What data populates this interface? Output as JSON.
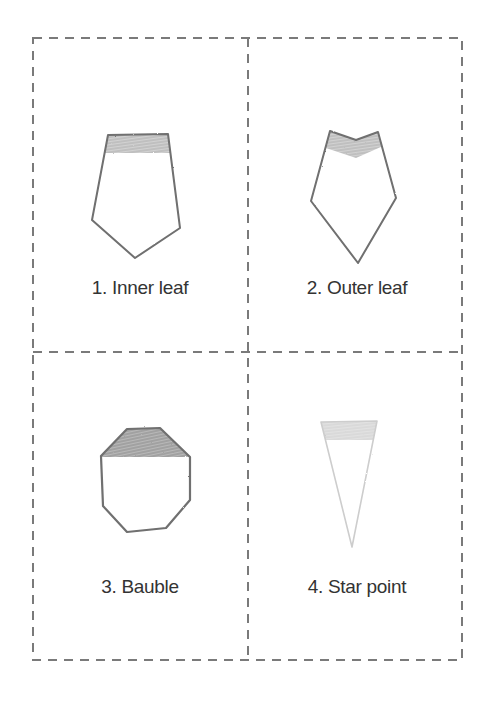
{
  "colors": {
    "background": "#ffffff",
    "dash": "#7a7a7a",
    "outline": "#6f6f6f",
    "outline_light": "#c9c9c9",
    "shading": "#bdbdbd",
    "shading_light": "#dcdcdc",
    "text": "#333333"
  },
  "cards": [
    {
      "id": 1,
      "label": "1. Inner leaf",
      "shape": "pentagon-leaf"
    },
    {
      "id": 2,
      "label": "2. Outer leaf",
      "shape": "notched-pentagon-leaf"
    },
    {
      "id": 3,
      "label": "3. Bauble",
      "shape": "octagon"
    },
    {
      "id": 4,
      "label": "4. Star point",
      "shape": "triangle"
    }
  ]
}
